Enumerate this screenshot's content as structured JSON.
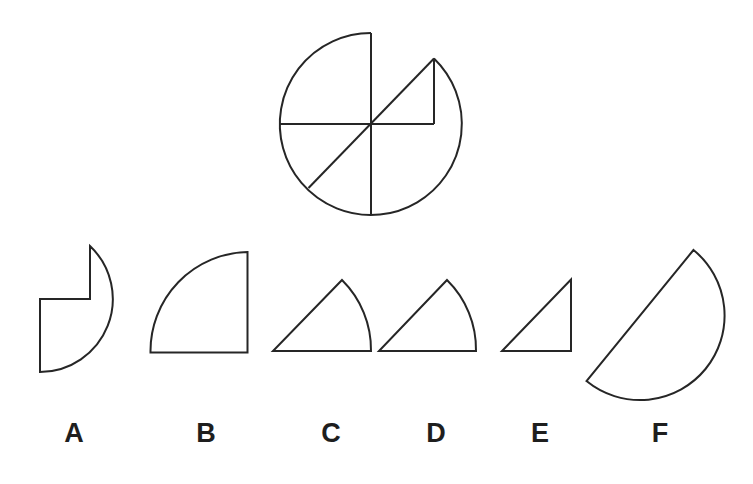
{
  "puzzle": {
    "stroke_color": "#262626",
    "background_color": "#ffffff",
    "main_figure": {
      "description": "circle with cut lines and a notch in the upper-right",
      "center": [
        371,
        124
      ],
      "radius": 91
    },
    "options": [
      {
        "label": "A",
        "description": "quarter-circle-like piece with rectangular notch"
      },
      {
        "label": "B",
        "description": "quarter circle"
      },
      {
        "label": "C",
        "description": "sector of about 45 degrees"
      },
      {
        "label": "D",
        "description": "sector of about 45 degrees"
      },
      {
        "label": "E",
        "description": "right triangle"
      },
      {
        "label": "F",
        "description": "semicircle"
      }
    ]
  }
}
